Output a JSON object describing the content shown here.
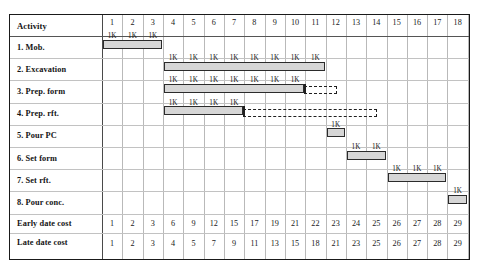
{
  "chart_data": {
    "type": "bar",
    "title": "",
    "xlabel": "",
    "ylabel": "",
    "header": {
      "activity_column_label": "Activity",
      "time_periods": [
        1,
        2,
        3,
        4,
        5,
        6,
        7,
        8,
        9,
        10,
        11,
        12,
        13,
        14,
        15,
        16,
        17,
        18
      ]
    },
    "activities": [
      {
        "label": "1. Mob.",
        "start": 1,
        "duration": 3,
        "cost_labels": [
          "1K",
          "1K",
          "1K"
        ],
        "float_end": null
      },
      {
        "label": "2. Excavation",
        "start": 4,
        "duration": 8,
        "cost_labels": [
          "1K",
          "1K",
          "1K",
          "1K",
          "1K",
          "1K",
          "1K",
          "1K"
        ],
        "float_end": null
      },
      {
        "label": "3. Prep. form",
        "start": 4,
        "duration": 7,
        "cost_labels": [
          "1K",
          "1K",
          "1K",
          "1K",
          "1K",
          "1K",
          "1K"
        ],
        "float_end": 12
      },
      {
        "label": "4. Prep. rft.",
        "start": 4,
        "duration": 4,
        "cost_labels": [
          "1K",
          "1K",
          "1K",
          "1K"
        ],
        "float_end": 14
      },
      {
        "label": "5. Pour PC",
        "start": 12,
        "duration": 1,
        "cost_labels": [
          "1K"
        ],
        "float_end": null
      },
      {
        "label": "6. Set form",
        "start": 13,
        "duration": 2,
        "cost_labels": [
          "1K",
          "1K"
        ],
        "float_end": null
      },
      {
        "label": "7. Set rft.",
        "start": 15,
        "duration": 3,
        "cost_labels": [
          "1K",
          "1K",
          "1K"
        ],
        "float_end": null
      },
      {
        "label": "8. Pour conc.",
        "start": 18,
        "duration": 1,
        "cost_labels": [
          "1K"
        ],
        "float_end": null
      }
    ],
    "cost_rows": [
      {
        "label": "Early date cost",
        "values": [
          1,
          2,
          3,
          6,
          9,
          12,
          15,
          17,
          19,
          21,
          22,
          23,
          24,
          25,
          26,
          27,
          28,
          29
        ]
      },
      {
        "label": "Late date cost",
        "values": [
          1,
          2,
          3,
          4,
          5,
          7,
          9,
          11,
          13,
          15,
          18,
          21,
          23,
          25,
          26,
          27,
          28,
          29
        ]
      }
    ],
    "colors": {
      "bar_fill": "#d6d6d6",
      "bar_border": "#2b2b2b",
      "grid": "#b9b9b9",
      "frame": "#1a1a1a",
      "float_line": "#1f1f1f"
    },
    "legend": [],
    "grid": true
  }
}
